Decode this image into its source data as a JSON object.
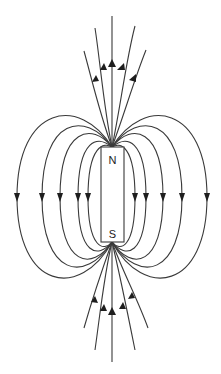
{
  "diagram": {
    "type": "magnetic-field-lines",
    "magnet": {
      "north_label": "N",
      "south_label": "S",
      "x": 101,
      "y": 147,
      "width": 23,
      "height": 95
    },
    "colors": {
      "line": "#3a3a3a",
      "arrow": "#1e1e1e",
      "magnet_fill": "#ffffff",
      "background": "#ffffff"
    },
    "side_loops": {
      "left_x": [
        17,
        42,
        60,
        78,
        88
      ],
      "right_x": [
        135,
        146,
        163,
        182,
        207
      ],
      "arrow_y": 197,
      "arrow_direction": "down"
    },
    "top_lines": {
      "count": 5,
      "arrow_direction": "up"
    },
    "bottom_lines": {
      "count": 5,
      "arrow_direction": "up"
    }
  }
}
